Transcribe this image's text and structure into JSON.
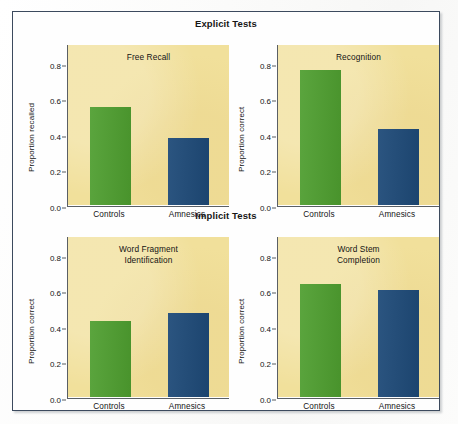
{
  "figure": {
    "sections": [
      {
        "id": "explicit",
        "title": "Explicit Tests"
      },
      {
        "id": "implicit",
        "title": "Implicit Tests"
      }
    ],
    "colors": {
      "controls_bar": "#4e9e2f",
      "amnesics_bar": "#1e4a78",
      "plot_background": "#f1e09b",
      "frame_border": "#3c4a5e",
      "axis": "#5a5f65",
      "text": "#131313"
    }
  },
  "chart_data": [
    {
      "type": "bar",
      "panel": "top-left",
      "section": "Explicit Tests",
      "title": "Free Recall",
      "categories": [
        "Controls",
        "Amnesics"
      ],
      "values": [
        0.55,
        0.375
      ],
      "xlabel": "",
      "ylabel": "Proportion recalled",
      "ylim": [
        0.0,
        0.9
      ],
      "yticks": [
        0.0,
        0.2,
        0.4,
        0.6,
        0.8
      ],
      "ytick_labels": [
        "0.0",
        "0.2",
        "0.4",
        "0.6",
        "0.8"
      ],
      "grid": false,
      "legend": "none",
      "series": [
        {
          "name": "Controls",
          "color": "#4e9e2f",
          "value": 0.55
        },
        {
          "name": "Amnesics",
          "color": "#1e4a78",
          "value": 0.375
        }
      ]
    },
    {
      "type": "bar",
      "panel": "top-right",
      "section": "Explicit Tests",
      "title": "Recognition",
      "categories": [
        "Controls",
        "Amnesics"
      ],
      "values": [
        0.76,
        0.425
      ],
      "xlabel": "",
      "ylabel": "Proportion correct",
      "ylim": [
        0.0,
        0.9
      ],
      "yticks": [
        0.0,
        0.2,
        0.4,
        0.6,
        0.8
      ],
      "ytick_labels": [
        "0.0",
        "0.2",
        "0.4",
        "0.6",
        "0.8"
      ],
      "grid": false,
      "legend": "none",
      "series": [
        {
          "name": "Controls",
          "color": "#4e9e2f",
          "value": 0.76
        },
        {
          "name": "Amnesics",
          "color": "#1e4a78",
          "value": 0.425
        }
      ]
    },
    {
      "type": "bar",
      "panel": "bottom-left",
      "section": "Implicit Tests",
      "title": "Word Fragment\nIdentification",
      "title_lines": [
        "Word Fragment",
        "Identification"
      ],
      "categories": [
        "Controls",
        "Amnesics"
      ],
      "values": [
        0.43,
        0.475
      ],
      "xlabel": "",
      "ylabel": "Proportion correct",
      "ylim": [
        0.0,
        0.9
      ],
      "yticks": [
        0.0,
        0.2,
        0.4,
        0.6,
        0.8
      ],
      "ytick_labels": [
        "0.0",
        "0.2",
        "0.4",
        "0.6",
        "0.8"
      ],
      "grid": false,
      "legend": "none",
      "series": [
        {
          "name": "Controls",
          "color": "#4e9e2f",
          "value": 0.43
        },
        {
          "name": "Amnesics",
          "color": "#1e4a78",
          "value": 0.475
        }
      ]
    },
    {
      "type": "bar",
      "panel": "bottom-right",
      "section": "Implicit Tests",
      "title": "Word Stem\nCompletion",
      "title_lines": [
        "Word Stem",
        "Completion"
      ],
      "categories": [
        "Controls",
        "Amnesics"
      ],
      "values": [
        0.635,
        0.6
      ],
      "xlabel": "",
      "ylabel": "Proportion correct",
      "ylim": [
        0.0,
        0.9
      ],
      "yticks": [
        0.0,
        0.2,
        0.4,
        0.6,
        0.8
      ],
      "ytick_labels": [
        "0.0",
        "0.2",
        "0.4",
        "0.6",
        "0.8"
      ],
      "grid": false,
      "legend": "none",
      "series": [
        {
          "name": "Controls",
          "color": "#4e9e2f",
          "value": 0.635
        },
        {
          "name": "Amnesics",
          "color": "#1e4a78",
          "value": 0.6
        }
      ]
    }
  ]
}
